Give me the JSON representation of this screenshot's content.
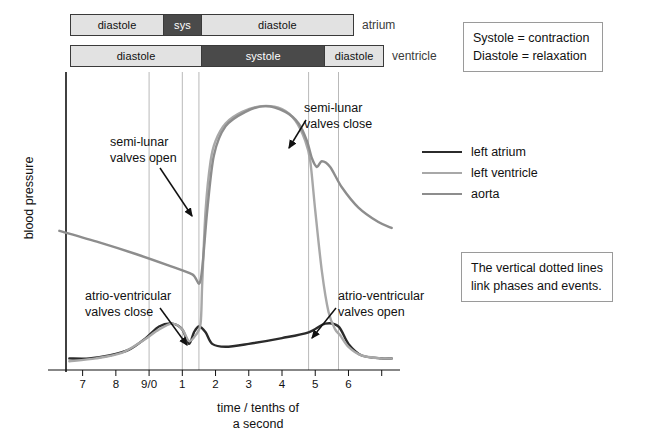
{
  "bars": {
    "atrium": {
      "row_label": "atrium",
      "segments": [
        {
          "label": "diastole",
          "tone": "light",
          "width_pct": 33.0
        },
        {
          "label": "sys",
          "tone": "dark",
          "width_pct": 13.4
        },
        {
          "label": "diastole",
          "tone": "light",
          "width_pct": 53.6
        }
      ]
    },
    "ventricle": {
      "row_label": "ventricle",
      "segments": [
        {
          "label": "diastole",
          "tone": "light",
          "width_pct": 42.0
        },
        {
          "label": "systole",
          "tone": "dark",
          "width_pct": 39.5
        },
        {
          "label": "diastole",
          "tone": "light",
          "width_pct": 18.5
        }
      ]
    }
  },
  "definitions": {
    "line1": "Systole = contraction",
    "line2": "Diastole = relaxation"
  },
  "dotted_note": {
    "line1": "The vertical dotted lines",
    "line2": "link phases and events."
  },
  "legend": {
    "items": [
      {
        "label": "left atrium",
        "color": "#2b2b2b"
      },
      {
        "label": "left ventricle",
        "color": "#a8a8a8"
      },
      {
        "label": "aorta",
        "color": "#8d8d8d"
      }
    ]
  },
  "chart_data": {
    "type": "line",
    "title": "",
    "xlabel": "time / tenths of a second",
    "ylabel": "blood pressure",
    "grid": false,
    "legend_position": "right",
    "xlim": [
      6.5,
      16.4
    ],
    "ylim": [
      0,
      100
    ],
    "xtick_positions": [
      7,
      8,
      9,
      10,
      11,
      12,
      13,
      14,
      15,
      16
    ],
    "xtick_labels": [
      "7",
      "8",
      "9/0",
      "1",
      "2",
      "3",
      "4",
      "5",
      "6"
    ],
    "vertical_dotted_lines": [
      9.0,
      10.0,
      10.5,
      13.8,
      14.7
    ],
    "series": [
      {
        "name": "left atrium",
        "color": "#2b2b2b",
        "points": [
          [
            6.6,
            4
          ],
          [
            7.2,
            4
          ],
          [
            7.8,
            5
          ],
          [
            8.4,
            7
          ],
          [
            8.9,
            11
          ],
          [
            9.3,
            15
          ],
          [
            9.7,
            16
          ],
          [
            10.0,
            14
          ],
          [
            10.2,
            9
          ],
          [
            10.35,
            13
          ],
          [
            10.5,
            15
          ],
          [
            10.7,
            13
          ],
          [
            10.9,
            9
          ],
          [
            11.3,
            8
          ],
          [
            12.0,
            9
          ],
          [
            13.0,
            11
          ],
          [
            13.8,
            13
          ],
          [
            14.3,
            16
          ],
          [
            14.7,
            15
          ],
          [
            15.0,
            9
          ],
          [
            15.4,
            5
          ],
          [
            16.0,
            4
          ],
          [
            16.3,
            4
          ]
        ]
      },
      {
        "name": "left ventricle",
        "color": "#a8a8a8",
        "points": [
          [
            6.6,
            3
          ],
          [
            7.4,
            4
          ],
          [
            8.2,
            6
          ],
          [
            8.8,
            10
          ],
          [
            9.3,
            14
          ],
          [
            9.7,
            16
          ],
          [
            10.0,
            14
          ],
          [
            10.2,
            10
          ],
          [
            10.4,
            12
          ],
          [
            10.55,
            16
          ],
          [
            10.6,
            30
          ],
          [
            10.7,
            55
          ],
          [
            10.85,
            72
          ],
          [
            11.0,
            79
          ],
          [
            11.3,
            85
          ],
          [
            11.8,
            89
          ],
          [
            12.4,
            91
          ],
          [
            13.0,
            90
          ],
          [
            13.4,
            86
          ],
          [
            13.7,
            79
          ],
          [
            13.85,
            72
          ],
          [
            14.0,
            55
          ],
          [
            14.2,
            34
          ],
          [
            14.4,
            20
          ],
          [
            14.6,
            14
          ],
          [
            14.75,
            12
          ],
          [
            15.0,
            8
          ],
          [
            15.4,
            5
          ],
          [
            16.0,
            4
          ],
          [
            16.3,
            4
          ]
        ]
      },
      {
        "name": "aorta",
        "color": "#8d8d8d",
        "points": [
          [
            6.3,
            48
          ],
          [
            7.5,
            44
          ],
          [
            8.6,
            40
          ],
          [
            9.6,
            36
          ],
          [
            10.3,
            33
          ],
          [
            10.55,
            31
          ],
          [
            10.75,
            55
          ],
          [
            10.95,
            74
          ],
          [
            11.3,
            84
          ],
          [
            11.9,
            89
          ],
          [
            12.5,
            91
          ],
          [
            13.1,
            89
          ],
          [
            13.5,
            85
          ],
          [
            13.75,
            79
          ],
          [
            13.9,
            73
          ],
          [
            14.05,
            70
          ],
          [
            14.2,
            72
          ],
          [
            14.45,
            70
          ],
          [
            14.8,
            63
          ],
          [
            15.3,
            56
          ],
          [
            15.9,
            51
          ],
          [
            16.3,
            49
          ]
        ]
      }
    ],
    "annotations": [
      {
        "id": "semi-lunar-valves-open",
        "line1": "semi-lunar",
        "line2": "valves open",
        "text_x": 110,
        "text_y": 146,
        "arrow_from": [
          160,
          168
        ],
        "arrow_to": [
          192,
          216
        ]
      },
      {
        "id": "semi-lunar-valves-close",
        "line1": "semi-lunar",
        "line2": "valves close",
        "text_x": 304,
        "text_y": 112,
        "arrow_from": [
          306,
          120
        ],
        "arrow_to": [
          289,
          148
        ]
      },
      {
        "id": "atrio-ventricular-valves-close",
        "line1": "atrio-ventricular",
        "line2": "valves close",
        "text_x": 85,
        "text_y": 300,
        "arrow_from": [
          160,
          308
        ],
        "arrow_to": [
          187,
          345
        ]
      },
      {
        "id": "atrio-ventricular-valves-open",
        "line1": "atrio-ventricular",
        "line2": "valves open",
        "text_x": 338,
        "text_y": 300,
        "arrow_from": [
          336,
          308
        ],
        "arrow_to": [
          312,
          338
        ]
      }
    ]
  },
  "axis": {
    "xlabel_line1": "time / tenths of",
    "xlabel_line2": "a second",
    "ylabel": "blood pressure"
  }
}
